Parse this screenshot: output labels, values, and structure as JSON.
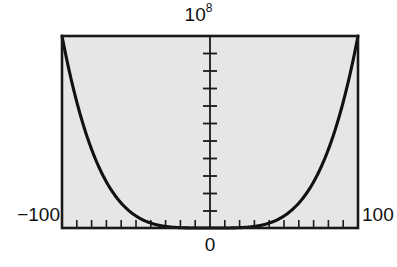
{
  "figure": {
    "background_color": "#ffffff",
    "plot_background_color": "#e6e6e6",
    "frame_color": "#1a1a1a",
    "curve_color": "#111111"
  },
  "labels": {
    "y_max_base": "10",
    "y_max_exponent": "8",
    "y_max_full": "10^8",
    "x_min": "−100",
    "x_max": "100",
    "x_origin": "0"
  },
  "chart_data": {
    "type": "line",
    "title": "",
    "subtitle": "",
    "xlabel": "",
    "ylabel": "",
    "function": "y = x^4",
    "xlim": [
      -100,
      100
    ],
    "ylim": [
      0,
      100000000
    ],
    "y_axis_scale_label": "10^8",
    "x_tick_labels": [
      "−100",
      "0",
      "100"
    ],
    "x_tick_label_values": [
      -100,
      0,
      100
    ],
    "y_tick_label_values": [
      100000000
    ],
    "x_minor_tick_interval": 10,
    "y_minor_tick_interval": 10000000,
    "x_minor_tick_count": 21,
    "y_minor_tick_count": 11,
    "grid": false,
    "legend": "none",
    "axis_style": "boxed-frame-with-central-vertical-axis",
    "x": [
      -100,
      -95,
      -90,
      -85,
      -80,
      -75,
      -70,
      -65,
      -60,
      -55,
      -50,
      -45,
      -40,
      -35,
      -30,
      -25,
      -20,
      -15,
      -10,
      -5,
      0,
      5,
      10,
      15,
      20,
      25,
      30,
      35,
      40,
      45,
      50,
      55,
      60,
      65,
      70,
      75,
      80,
      85,
      90,
      95,
      100
    ],
    "y": [
      100000000,
      81450625,
      65610000,
      52200625,
      40960000,
      31640625,
      24010000,
      17850625,
      12960000,
      9150625,
      6250000,
      4100625,
      2560000,
      1500625,
      810000,
      390625,
      160000,
      50625,
      10000,
      625,
      0,
      625,
      10000,
      50625,
      160000,
      390625,
      810000,
      1500625,
      2560000,
      4100625,
      6250000,
      9150625,
      12960000,
      17850625,
      24010000,
      31640625,
      40960000,
      52200625,
      65610000,
      81450625,
      100000000
    ],
    "series": [
      {
        "name": "x^4",
        "values": [
          100000000,
          81450625,
          65610000,
          52200625,
          40960000,
          31640625,
          24010000,
          17850625,
          12960000,
          9150625,
          6250000,
          4100625,
          2560000,
          1500625,
          810000,
          390625,
          160000,
          50625,
          10000,
          625,
          0,
          625,
          10000,
          50625,
          160000,
          390625,
          810000,
          1500625,
          2560000,
          4100625,
          6250000,
          9150625,
          12960000,
          17850625,
          24010000,
          31640625,
          40960000,
          52200625,
          65610000,
          81450625,
          100000000
        ]
      }
    ]
  }
}
